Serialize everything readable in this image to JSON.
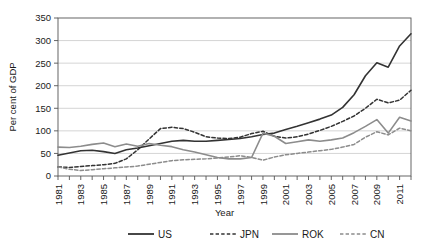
{
  "chart_data": {
    "type": "line",
    "title": "",
    "xlabel": "Year",
    "ylabel": "Per cent of GDP",
    "xlim": [
      1981,
      2012
    ],
    "ylim": [
      0,
      350
    ],
    "ytick_step": 50,
    "yticks": [
      "0",
      "50",
      "100",
      "150",
      "200",
      "250",
      "300",
      "350"
    ],
    "grid": "horizontal",
    "legend_position": "bottom",
    "x": [
      1981,
      1982,
      1983,
      1984,
      1985,
      1986,
      1987,
      1988,
      1989,
      1990,
      1991,
      1992,
      1993,
      1994,
      1995,
      1996,
      1997,
      1998,
      1999,
      2000,
      2001,
      2002,
      2003,
      2004,
      2005,
      2006,
      2007,
      2008,
      2009,
      2010,
      2011,
      2012
    ],
    "xticks_major": [
      "1981",
      "1983",
      "1985",
      "1987",
      "1989",
      "1991",
      "1993",
      "1995",
      "1997",
      "1999",
      "2001",
      "2003",
      "2005",
      "2007",
      "2009",
      "2011"
    ],
    "series": [
      {
        "name": "US",
        "style": "solid",
        "color": "#333333",
        "values": [
          46,
          51,
          56,
          57,
          54,
          50,
          58,
          62,
          67,
          72,
          77,
          79,
          77,
          77,
          79,
          81,
          83,
          87,
          92,
          95,
          103,
          110,
          118,
          126,
          135,
          152,
          180,
          222,
          251,
          241,
          288,
          315
        ]
      },
      {
        "name": "JPN",
        "style": "dashed",
        "color": "#333333",
        "values": [
          20,
          19,
          21,
          23,
          25,
          28,
          38,
          58,
          82,
          105,
          108,
          105,
          97,
          87,
          84,
          83,
          86,
          94,
          99,
          88,
          84,
          87,
          93,
          101,
          110,
          121,
          133,
          150,
          170,
          162,
          168,
          190
        ]
      },
      {
        "name": "ROK",
        "style": "solid",
        "color": "#8c8c8c",
        "values": [
          64,
          63,
          66,
          70,
          73,
          65,
          71,
          66,
          72,
          68,
          65,
          58,
          53,
          47,
          41,
          38,
          38,
          41,
          95,
          88,
          72,
          76,
          80,
          77,
          80,
          84,
          96,
          110,
          125,
          95,
          130,
          122
        ]
      },
      {
        "name": "CN",
        "style": "dashed",
        "color": "#8c8c8c",
        "values": [
          20,
          15,
          12,
          14,
          16,
          18,
          20,
          22,
          26,
          30,
          34,
          36,
          37,
          38,
          40,
          42,
          45,
          41,
          35,
          42,
          47,
          50,
          53,
          56,
          59,
          64,
          70,
          86,
          98,
          91,
          106,
          100
        ]
      }
    ]
  },
  "legend": {
    "entries": [
      {
        "label": "US"
      },
      {
        "label": "JPN"
      },
      {
        "label": "ROK"
      },
      {
        "label": "CN"
      }
    ]
  }
}
